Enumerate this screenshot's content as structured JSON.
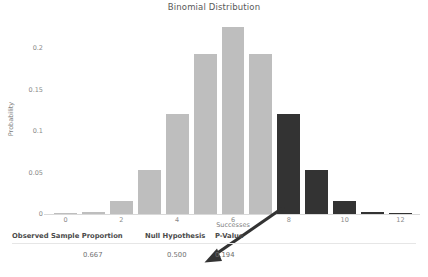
{
  "figure": {
    "title": "Binomial Distribution"
  },
  "axes": {
    "xlabel": "Successes",
    "ylabel": "Probability",
    "xticks": [
      "0",
      "2",
      "4",
      "6",
      "8",
      "10",
      "12"
    ],
    "yticks": [
      "0",
      "0.05",
      "0.1",
      "0.15",
      "0.2"
    ]
  },
  "colors": {
    "bar": "#bebebe",
    "bar_significant": "#333333",
    "text": "#595959",
    "axis": "#d9d9d9",
    "arrow": "#333333"
  },
  "table": {
    "headers": [
      "Observed Sample Proportion",
      "Null Hypothesis",
      "P-Value"
    ],
    "values": [
      "0.667",
      "0.500",
      "0.194"
    ]
  },
  "chart_data": {
    "type": "bar",
    "title": "Binomial Distribution",
    "xlabel": "Successes",
    "ylabel": "Probability",
    "categories": [
      0,
      1,
      2,
      3,
      4,
      5,
      6,
      7,
      8,
      9,
      10,
      11,
      12
    ],
    "values": [
      0.0002,
      0.0029,
      0.0161,
      0.0537,
      0.1208,
      0.1934,
      0.2256,
      0.1934,
      0.1208,
      0.0537,
      0.0161,
      0.0029,
      0.0002
    ],
    "highlighted": [
      8,
      9,
      10,
      11,
      12
    ],
    "xlim": [
      -0.7,
      12.7
    ],
    "ylim": [
      0,
      0.2318
    ],
    "xticks": [
      0,
      2,
      4,
      6,
      8,
      10,
      12
    ],
    "yticks": [
      0,
      0.05,
      0.1,
      0.15,
      0.2
    ],
    "grid": false,
    "legend": null,
    "annotation": {
      "text": "0.194",
      "points_from": [
        8,
        0
      ],
      "points_to": "p-value-cell"
    }
  }
}
